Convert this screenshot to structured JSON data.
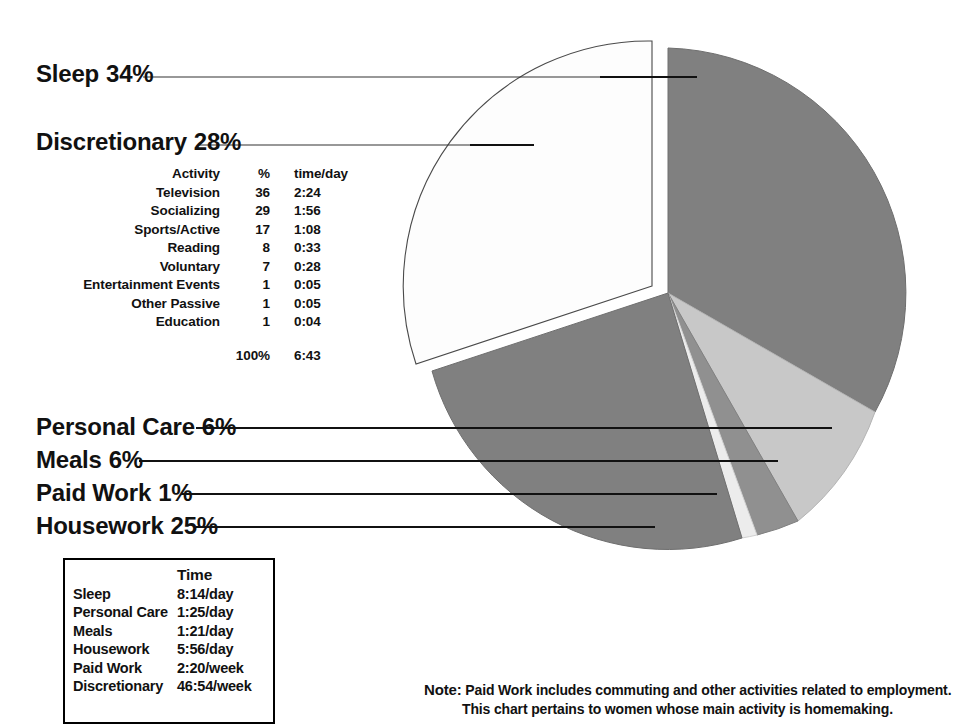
{
  "chart_data": {
    "type": "pie",
    "title": "",
    "unit": "%",
    "categories": [
      "Sleep",
      "Discretionary",
      "Personal Care",
      "Meals",
      "Paid Work",
      "Housework"
    ],
    "values": [
      34,
      28,
      6,
      6,
      1,
      25
    ],
    "colors": [
      "#808080",
      "#ffffff",
      "#c8c8c8",
      "#909090",
      "#e8e8e8",
      "#808080"
    ],
    "exploded": [
      "Discretionary"
    ],
    "legend": "callout-labels",
    "grid": false,
    "slices": [
      {
        "label": "Sleep",
        "percent": 34,
        "display": "34%",
        "color": "#808080"
      },
      {
        "label": "Discretionary",
        "percent": 28,
        "display": "28%",
        "color": "#ffffff"
      },
      {
        "label": "Personal Care",
        "percent": 6,
        "display": "6%",
        "color": "#c8c8c8"
      },
      {
        "label": "Meals",
        "percent": 6,
        "display": "6%",
        "color": "#909090"
      },
      {
        "label": "Paid Work",
        "percent": 1,
        "display": "1%",
        "color": "#e8e8e8"
      },
      {
        "label": "Housework",
        "percent": 25,
        "display": "25%",
        "color": "#808080"
      }
    ]
  },
  "callouts": {
    "sleep": {
      "name": "Sleep",
      "pct": "34%"
    },
    "discretionary": {
      "name": "Discretionary",
      "pct": "28%"
    },
    "personal_care": {
      "name": "Personal Care",
      "pct": "6%"
    },
    "meals": {
      "name": "Meals",
      "pct": "6%"
    },
    "paid_work": {
      "name": "Paid Work",
      "pct": "1%"
    },
    "housework": {
      "name": "Housework",
      "pct": "25%"
    }
  },
  "discretionary_table": {
    "headers": {
      "activity": "Activity",
      "percent": "%",
      "time": "time/day"
    },
    "rows": [
      {
        "activity": "Television",
        "percent": "36",
        "time": "2:24"
      },
      {
        "activity": "Socializing",
        "percent": "29",
        "time": "1:56"
      },
      {
        "activity": "Sports/Active",
        "percent": "17",
        "time": "1:08"
      },
      {
        "activity": "Reading",
        "percent": "8",
        "time": "0:33"
      },
      {
        "activity": "Voluntary",
        "percent": "7",
        "time": "0:28"
      },
      {
        "activity": "Entertainment Events",
        "percent": "1",
        "time": "0:05"
      },
      {
        "activity": "Other Passive",
        "percent": "1",
        "time": "0:05"
      },
      {
        "activity": "Education",
        "percent": "1",
        "time": "0:04"
      }
    ],
    "total": {
      "activity": "",
      "percent": "100%",
      "time": "6:43"
    }
  },
  "time_box": {
    "headers": {
      "name": "",
      "time": "Time"
    },
    "rows": [
      {
        "name": "Sleep",
        "time": "8:14/day"
      },
      {
        "name": "Personal Care",
        "time": "1:25/day"
      },
      {
        "name": "Meals",
        "time": "1:21/day"
      },
      {
        "name": "Housework",
        "time": "5:56/day"
      },
      {
        "name": "Paid Work",
        "time": "2:20/week"
      },
      {
        "name": "Discretionary",
        "time": "46:54/week"
      }
    ]
  },
  "note": {
    "label": "Note:",
    "line1": "Paid Work includes commuting and other activities related to employment.",
    "line2": "This chart pertains to women whose main activity is homemaking."
  }
}
